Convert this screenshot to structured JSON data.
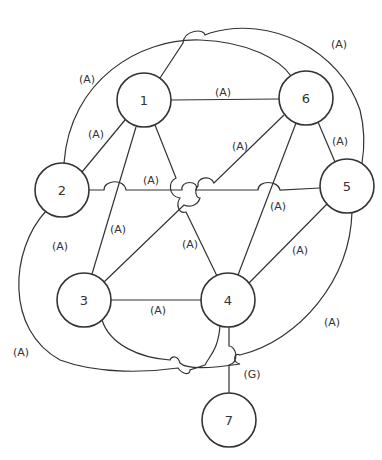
{
  "diagram": {
    "nodes": [
      {
        "id": "1",
        "label": "1",
        "x": 144,
        "y": 100,
        "r": 27
      },
      {
        "id": "2",
        "label": "2",
        "x": 62,
        "y": 190,
        "r": 27
      },
      {
        "id": "3",
        "label": "3",
        "x": 84,
        "y": 300,
        "r": 27
      },
      {
        "id": "4",
        "label": "4",
        "x": 228,
        "y": 300,
        "r": 27
      },
      {
        "id": "5",
        "label": "5",
        "x": 347,
        "y": 186,
        "r": 27
      },
      {
        "id": "6",
        "label": "6",
        "x": 306,
        "y": 98,
        "r": 27
      },
      {
        "id": "7",
        "label": "7",
        "x": 229,
        "y": 420,
        "r": 27
      }
    ],
    "edges": [
      {
        "from": "1",
        "to": "6",
        "label": "(A)"
      },
      {
        "from": "1",
        "to": "2",
        "label": "(A)"
      },
      {
        "from": "1",
        "to": "3",
        "label": "(A)"
      },
      {
        "from": "1",
        "to": "4",
        "label": "(A)"
      },
      {
        "from": "2",
        "to": "5",
        "label": "(A)"
      },
      {
        "from": "2",
        "to": "3",
        "label": "(A)"
      },
      {
        "from": "2",
        "to": "6",
        "label": "(A)"
      },
      {
        "from": "2",
        "to": "4",
        "label": "(A)"
      },
      {
        "from": "6",
        "to": "3",
        "label": "(A)"
      },
      {
        "from": "6",
        "to": "4",
        "label": "(A)"
      },
      {
        "from": "6",
        "to": "5",
        "label": "(A)"
      },
      {
        "from": "1",
        "to": "5",
        "label": "(A)"
      },
      {
        "from": "5",
        "to": "4",
        "label": "(A)"
      },
      {
        "from": "5",
        "to": "3",
        "label": "(A)"
      },
      {
        "from": "3",
        "to": "4",
        "label": "(A)"
      },
      {
        "from": "4",
        "to": "7",
        "label": "(G)"
      }
    ],
    "edge_labels": {
      "e16": "(A)",
      "e12": "(A)",
      "e13": "(A)",
      "e14": "(A)",
      "e25": "(A)",
      "e23": "(A)",
      "e26": "(A)",
      "e24": "(A)",
      "e63": "(A)",
      "e64": "(A)",
      "e65": "(A)",
      "e15": "(A)",
      "e54": "(A)",
      "e53": "(A)",
      "e34": "(A)",
      "e47": "(G)"
    },
    "node_labels": {
      "n1": "1",
      "n2": "2",
      "n3": "3",
      "n4": "4",
      "n5": "5",
      "n6": "6",
      "n7": "7"
    }
  }
}
